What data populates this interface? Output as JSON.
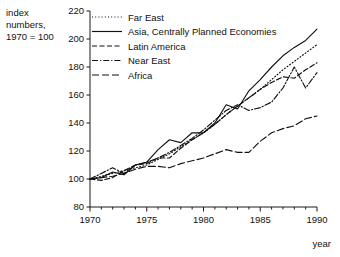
{
  "chart_data": {
    "type": "line",
    "title": "",
    "xlabel": "year",
    "ylabel": "index numbers, 1970 = 100",
    "ylabel_line1": "index",
    "ylabel_line2": "numbers,",
    "ylabel_line3": "1970 = 100",
    "xlim": [
      1970,
      1990
    ],
    "ylim": [
      80,
      220
    ],
    "y_ticks": [
      80,
      100,
      120,
      140,
      160,
      180,
      200,
      220
    ],
    "y_tick_labels": [
      "80",
      "100",
      "120",
      "140",
      "160",
      "180",
      "200",
      "220"
    ],
    "x_ticks": [
      1970,
      1971,
      1972,
      1973,
      1974,
      1975,
      1976,
      1977,
      1978,
      1979,
      1980,
      1981,
      1982,
      1983,
      1984,
      1985,
      1986,
      1987,
      1988,
      1989,
      1990
    ],
    "x_tick_labels_major": [
      "1970",
      "1975",
      "1980",
      "1985",
      "1990"
    ],
    "x_major_ticks": [
      1970,
      1975,
      1980,
      1985,
      1990
    ],
    "grid": false,
    "legend_position": "top-left-inside",
    "x": [
      1970,
      1971,
      1972,
      1973,
      1974,
      1975,
      1976,
      1977,
      1978,
      1979,
      1980,
      1981,
      1982,
      1983,
      1984,
      1985,
      1986,
      1987,
      1988,
      1989,
      1990
    ],
    "series": [
      {
        "name": "Far East",
        "dash": "1,2.2",
        "values": [
          100,
          102,
          104,
          106,
          108,
          110,
          114,
          118,
          123,
          128,
          133,
          139,
          146,
          152,
          158,
          164,
          171,
          178,
          184,
          190,
          196
        ]
      },
      {
        "name": "Asia, Centrally Planned Economies",
        "dash": "",
        "values": [
          100,
          101,
          105,
          103,
          110,
          112,
          121,
          128,
          126,
          133,
          133,
          140,
          153,
          150,
          163,
          171,
          180,
          188,
          194,
          199,
          207
        ]
      },
      {
        "name": "Latin America",
        "dash": "5,2.5",
        "values": [
          100,
          99,
          101,
          106,
          110,
          111,
          115,
          115,
          122,
          128,
          133,
          139,
          146,
          152,
          158,
          164,
          169,
          173,
          172,
          178,
          183
        ]
      },
      {
        "name": "Near East",
        "dash": "6,2,1.2,2",
        "values": [
          100,
          104,
          108,
          104,
          110,
          112,
          115,
          119,
          124,
          129,
          135,
          142,
          149,
          153,
          149,
          151,
          155,
          165,
          180,
          165,
          176
        ]
      },
      {
        "name": "Africa",
        "dash": "7,3",
        "values": [
          100,
          101,
          102,
          104,
          107,
          109,
          109,
          108,
          111,
          113,
          115,
          118,
          121,
          119,
          119,
          127,
          133,
          136,
          138,
          143,
          145
        ]
      }
    ]
  },
  "legend": {
    "items": [
      {
        "label": "Far East"
      },
      {
        "label": "Asia, Centrally Planned Economies"
      },
      {
        "label": "Latin America"
      },
      {
        "label": "Near East"
      },
      {
        "label": "Africa"
      }
    ]
  },
  "axes": {
    "y_caption_lines": [
      "index",
      "numbers,",
      "1970 = 100"
    ],
    "x_caption": "year"
  },
  "colors": {
    "ink": "#111111",
    "background": "#ffffff"
  }
}
